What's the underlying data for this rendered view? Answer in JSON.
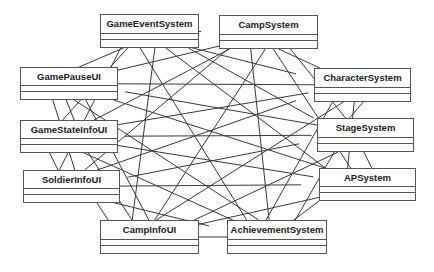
{
  "diagram": {
    "type": "uml-class-diagram",
    "line_color": "#3a3a3a",
    "box_border_color": "#555555",
    "classes": [
      {
        "id": "GameEventSystem",
        "label": "GameEventSystem",
        "x": 100,
        "y": 14,
        "w": 99,
        "h": 34
      },
      {
        "id": "CampSystem",
        "label": "CampSystem",
        "x": 219,
        "y": 15,
        "w": 99,
        "h": 34
      },
      {
        "id": "GamePauseUI",
        "label": "GamePauseUI",
        "x": 20,
        "y": 67,
        "w": 98,
        "h": 33
      },
      {
        "id": "CharacterSystem",
        "label": "CharacterSystem",
        "x": 314,
        "y": 68,
        "w": 97,
        "h": 34
      },
      {
        "id": "GameStateInfoUI",
        "label": "GameStateInfoUI",
        "x": 20,
        "y": 120,
        "w": 98,
        "h": 33
      },
      {
        "id": "StageSystem",
        "label": "StageSystem",
        "x": 317,
        "y": 118,
        "w": 97,
        "h": 34
      },
      {
        "id": "SoldierInfoUI",
        "label": "SoldierInfoUI",
        "x": 23,
        "y": 170,
        "w": 97,
        "h": 33
      },
      {
        "id": "APSystem",
        "label": "APSystem",
        "x": 319,
        "y": 168,
        "w": 97,
        "h": 33
      },
      {
        "id": "CampInfoUI",
        "label": "CampInfoUI",
        "x": 100,
        "y": 220,
        "w": 99,
        "h": 34
      },
      {
        "id": "AchievementSystem",
        "label": "AchievementSystem",
        "x": 227,
        "y": 220,
        "w": 100,
        "h": 34
      }
    ],
    "connections": "all-to-all"
  }
}
